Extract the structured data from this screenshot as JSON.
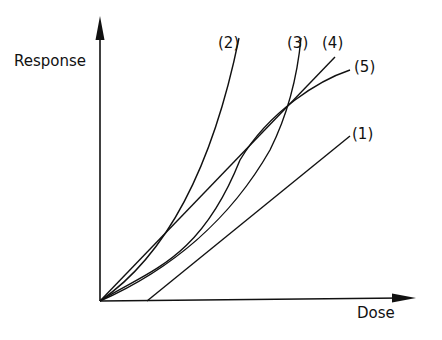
{
  "chart_data": {
    "type": "line",
    "title": "",
    "xlabel": "Dose",
    "ylabel": "Response",
    "grid": false,
    "legend": "inline labels at curve ends",
    "axes": {
      "origin": [
        100,
        301
      ],
      "x_end": [
        415,
        298
      ],
      "y_end": [
        100,
        18
      ]
    },
    "series": [
      {
        "name": "(1)",
        "shape": "linear with dose threshold",
        "path": "M 147 301 L 350 136",
        "label_pos": [
          352,
          127
        ]
      },
      {
        "name": "(2)",
        "shape": "steep convex",
        "path": "M 100 301 C 160 260, 210 180, 239 38",
        "label_pos": [
          218,
          36
        ]
      },
      {
        "name": "(3)",
        "shape": "convex, accelerating",
        "path": "M 100 301 C 170 270, 230 220, 270 150 C 290 110, 298 70, 301 38",
        "label_pos": [
          287,
          36
        ]
      },
      {
        "name": "(4)",
        "shape": "linear from origin",
        "path": "M 100 301 L 335 57",
        "label_pos": [
          322,
          36
        ]
      },
      {
        "name": "(5)",
        "shape": "sigmoid, saturating",
        "path": "M 100 301 C 150 270, 200 260, 240 160 C 270 110, 320 80, 350 70",
        "label_pos": [
          354,
          60
        ]
      }
    ]
  },
  "colors": {
    "ink": "#111111",
    "background": "#ffffff"
  }
}
